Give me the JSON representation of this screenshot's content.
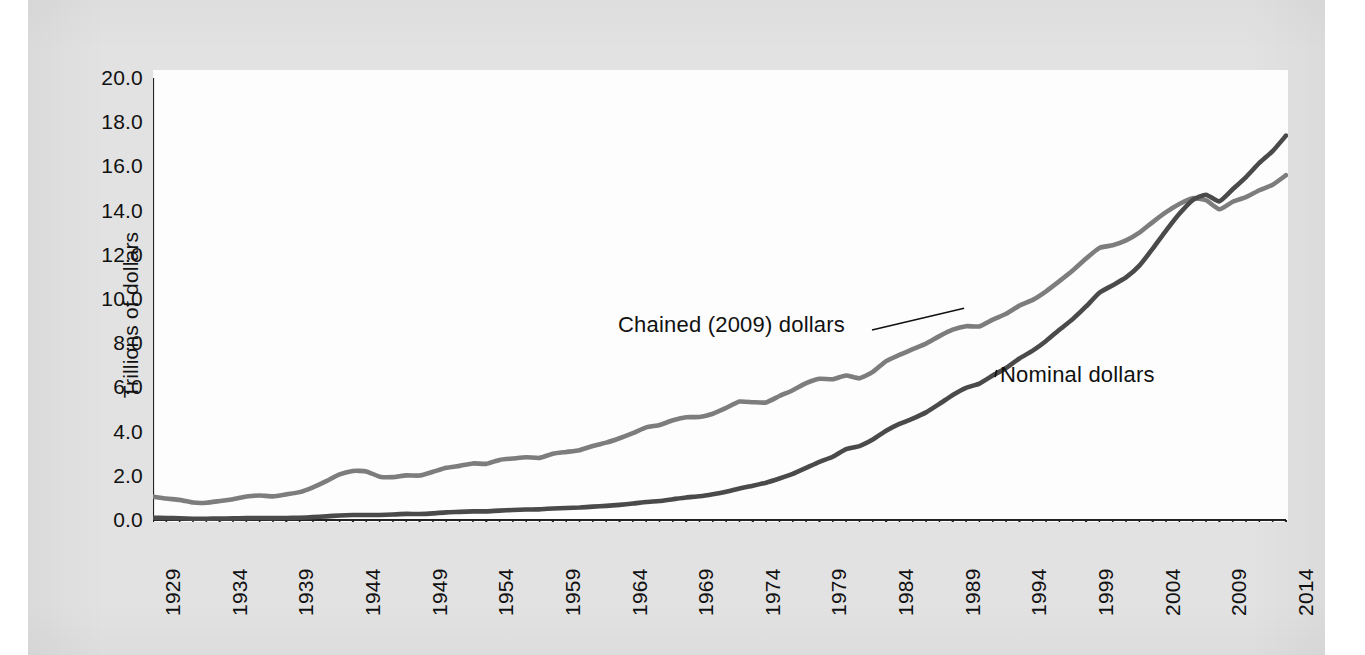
{
  "chart_data": {
    "type": "line",
    "title": "",
    "xlabel": "",
    "ylabel": "Trillions of dollars",
    "xlim": [
      1929,
      2014
    ],
    "ylim": [
      0.0,
      20.0
    ],
    "grid": false,
    "legend_position": "inline-annotations",
    "ytick_labels": [
      "20.0",
      "18.0",
      "16.0",
      "14.0",
      "12.0",
      "10.0",
      "8.0",
      "6.0",
      "4.0",
      "2.0",
      "0.0"
    ],
    "ytick_values": [
      20.0,
      18.0,
      16.0,
      14.0,
      12.0,
      10.0,
      8.0,
      6.0,
      4.0,
      2.0,
      0.0
    ],
    "xtick_labels": [
      "1929",
      "1934",
      "1939",
      "1944",
      "1949",
      "1954",
      "1959",
      "1964",
      "1969",
      "1974",
      "1979",
      "1984",
      "1989",
      "1994",
      "1999",
      "2004",
      "2009",
      "2014"
    ],
    "xtick_values": [
      1929,
      1934,
      1939,
      1944,
      1949,
      1954,
      1959,
      1964,
      1969,
      1974,
      1979,
      1984,
      1989,
      1994,
      1999,
      2004,
      2009,
      2014
    ],
    "x": [
      1929,
      1930,
      1931,
      1932,
      1933,
      1934,
      1935,
      1936,
      1937,
      1938,
      1939,
      1940,
      1941,
      1942,
      1943,
      1944,
      1945,
      1946,
      1947,
      1948,
      1949,
      1950,
      1951,
      1952,
      1953,
      1954,
      1955,
      1956,
      1957,
      1958,
      1959,
      1960,
      1961,
      1962,
      1963,
      1964,
      1965,
      1966,
      1967,
      1968,
      1969,
      1970,
      1971,
      1972,
      1973,
      1974,
      1975,
      1976,
      1977,
      1978,
      1979,
      1980,
      1981,
      1982,
      1983,
      1984,
      1985,
      1986,
      1987,
      1988,
      1989,
      1990,
      1991,
      1992,
      1993,
      1994,
      1995,
      1996,
      1997,
      1998,
      1999,
      2000,
      2001,
      2002,
      2003,
      2004,
      2005,
      2006,
      2007,
      2008,
      2009,
      2010,
      2011,
      2012,
      2013,
      2014
    ],
    "series": [
      {
        "name": "Chained (2009) dollars",
        "color": "#7d7d7d",
        "values": [
          1.06,
          0.97,
          0.91,
          0.79,
          0.78,
          0.86,
          0.94,
          1.06,
          1.11,
          1.07,
          1.16,
          1.26,
          1.48,
          1.76,
          2.06,
          2.22,
          2.2,
          1.96,
          1.94,
          2.02,
          2.01,
          2.18,
          2.36,
          2.45,
          2.56,
          2.54,
          2.72,
          2.78,
          2.84,
          2.81,
          3.0,
          3.08,
          3.16,
          3.35,
          3.5,
          3.7,
          3.93,
          4.19,
          4.3,
          4.51,
          4.65,
          4.66,
          4.81,
          5.07,
          5.36,
          5.33,
          5.32,
          5.61,
          5.87,
          6.19,
          6.39,
          6.37,
          6.54,
          6.41,
          6.7,
          7.19,
          7.47,
          7.73,
          7.98,
          8.32,
          8.61,
          8.77,
          8.76,
          9.07,
          9.33,
          9.7,
          9.96,
          10.35,
          10.81,
          11.29,
          11.83,
          12.31,
          12.43,
          12.65,
          13.0,
          13.48,
          13.93,
          14.3,
          14.56,
          14.47,
          14.06,
          14.4,
          14.61,
          14.92,
          15.17,
          15.6
        ]
      },
      {
        "name": "Nominal dollars",
        "color": "#4a4a4a",
        "values": [
          0.105,
          0.092,
          0.077,
          0.059,
          0.057,
          0.066,
          0.074,
          0.085,
          0.093,
          0.087,
          0.093,
          0.103,
          0.129,
          0.166,
          0.203,
          0.224,
          0.228,
          0.228,
          0.25,
          0.275,
          0.273,
          0.3,
          0.347,
          0.367,
          0.389,
          0.391,
          0.426,
          0.45,
          0.474,
          0.482,
          0.522,
          0.543,
          0.563,
          0.605,
          0.638,
          0.685,
          0.743,
          0.815,
          0.862,
          0.942,
          1.02,
          1.076,
          1.168,
          1.282,
          1.429,
          1.549,
          1.689,
          1.878,
          2.086,
          2.357,
          2.632,
          2.863,
          3.211,
          3.345,
          3.639,
          4.041,
          4.347,
          4.59,
          4.87,
          5.253,
          5.658,
          5.98,
          6.174,
          6.539,
          6.879,
          7.309,
          7.664,
          8.1,
          8.609,
          9.089,
          9.661,
          10.285,
          10.622,
          10.978,
          11.511,
          12.275,
          13.094,
          13.856,
          14.478,
          14.719,
          14.419,
          14.964,
          15.518,
          16.155,
          16.692,
          17.393
        ]
      }
    ],
    "annotations": [
      {
        "text": "Chained (2009) dollars",
        "target_year": 1990,
        "target_value": 9.4
      },
      {
        "text": "Nominal dollars",
        "target_year": 1992,
        "target_value": 6.7
      }
    ]
  },
  "axis": {
    "y_title": "Trillions of dollars"
  },
  "ghost_text": [
    {
      "text": "in the same period and the relative price",
      "x": 195,
      "y": 96
    },
    {
      "text": "of the production of new goods and",
      "x": 640,
      "y": 96
    },
    {
      "text": "services measured in",
      "x": 1010,
      "y": 96
    },
    {
      "text": "and its cost, as prices rose",
      "x": 470,
      "y": 122
    },
    {
      "text": "current dollars",
      "x": 705,
      "y": 122
    },
    {
      "text": "the value of final goods is a better measure. The GDP deflator",
      "x": 196,
      "y": 150
    },
    {
      "text": "in a given year and measured in prices of a base year, the",
      "x": 700,
      "y": 150
    },
    {
      "text": "includes the GDP deflator, which is calculated from nominal",
      "x": 195,
      "y": 176
    },
    {
      "text": "output, the aggregate price level. Inflation is the percent",
      "x": 705,
      "y": 176
    },
    {
      "text": "output and real output in chained dollars of the base year",
      "x": 196,
      "y": 202
    },
    {
      "text": "change of the price level between two periods of time",
      "x": 705,
      "y": 202
    },
    {
      "text": "measured between 1929 and 2014 in the U.S.",
      "x": 196,
      "y": 228
    },
    {
      "text": "with nominal GDP rising faster than real GDP",
      "x": 700,
      "y": 256
    },
    {
      "text": "Measures of output",
      "x": 196,
      "y": 420
    },
    {
      "text": "and prices in the national income accounts",
      "x": 470,
      "y": 420
    },
    {
      "text": "are revised each year by",
      "x": 880,
      "y": 420
    },
    {
      "text": "the Bureau of Economic Analysis",
      "x": 196,
      "y": 448
    },
    {
      "text": "using source data from surveys",
      "x": 560,
      "y": 448
    },
    {
      "text": "and tax records",
      "x": 930,
      "y": 448
    }
  ]
}
